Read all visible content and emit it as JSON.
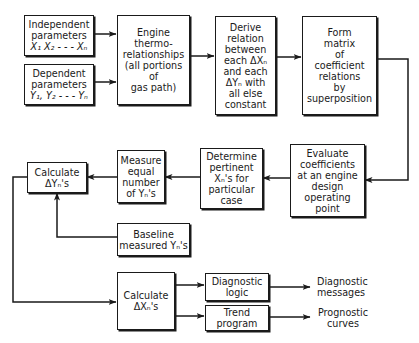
{
  "diagram": {
    "type": "flowchart",
    "boxes": {
      "independent": {
        "lines": [
          "Independent",
          "parameters",
          "X₁ X₂ - - - Xₙ"
        ]
      },
      "dependent": {
        "lines": [
          "Dependent",
          "parameters",
          "Y₁, Y₂ - - - Yₙ"
        ]
      },
      "engine": {
        "lines": [
          "Engine",
          "thermo-",
          "relationships",
          "(all portions",
          "of",
          "gas path)"
        ]
      },
      "derive": {
        "lines": [
          "Derive",
          "relation",
          "between",
          "each ΔXₙ",
          "and each",
          "ΔYₙ with",
          "all else",
          "constant"
        ]
      },
      "matrix": {
        "lines": [
          "Form",
          "matrix",
          "of",
          "coefficient",
          "relations",
          "by",
          "superposition"
        ]
      },
      "evaluate": {
        "lines": [
          "Evaluate",
          "coefficients",
          "at an engine",
          "design",
          "operating",
          "point"
        ]
      },
      "determine": {
        "lines": [
          "Determine",
          "pertinent",
          "Xₙ's for",
          "particular",
          "case"
        ]
      },
      "measure": {
        "lines": [
          "Measure",
          "equal",
          "number",
          "of Yₙ's"
        ]
      },
      "calc_dy": {
        "lines": [
          "Calculate",
          "ΔYₙ's"
        ]
      },
      "baseline": {
        "lines": [
          "Baseline",
          "measured Yₙ's"
        ]
      },
      "calc_dx": {
        "lines": [
          "Calculate",
          "ΔXₙ's"
        ]
      },
      "diag_logic": {
        "lines": [
          "Diagnostic",
          "logic"
        ]
      },
      "trend": {
        "lines": [
          "Trend",
          "program"
        ]
      }
    },
    "outputs": {
      "diag_messages": {
        "lines": [
          "Diagnostic",
          "messages"
        ]
      },
      "prognostic": {
        "lines": [
          "Prognostic",
          "curves"
        ]
      }
    },
    "edges": [
      [
        "independent",
        "engine"
      ],
      [
        "dependent",
        "engine"
      ],
      [
        "engine",
        "derive"
      ],
      [
        "derive",
        "matrix"
      ],
      [
        "matrix",
        "evaluate"
      ],
      [
        "evaluate",
        "determine"
      ],
      [
        "determine",
        "measure"
      ],
      [
        "measure",
        "calc_dy"
      ],
      [
        "baseline",
        "calc_dy"
      ],
      [
        "calc_dy",
        "calc_dx"
      ],
      [
        "calc_dx",
        "diag_logic"
      ],
      [
        "calc_dx",
        "trend"
      ],
      [
        "diag_logic",
        "diag_messages"
      ],
      [
        "trend",
        "prognostic"
      ]
    ]
  }
}
